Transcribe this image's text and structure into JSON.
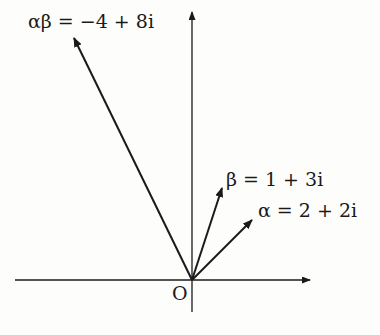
{
  "diagram": {
    "type": "argand-diagram",
    "origin_label": "O",
    "vectors": [
      {
        "name": "alpha",
        "label": "α = 2 + 2i",
        "re": 2,
        "im": 2
      },
      {
        "name": "beta",
        "label": "β = 1 + 3i",
        "re": 1,
        "im": 3
      },
      {
        "name": "alpha-beta",
        "label": "αβ = −4 + 8i",
        "re": -4,
        "im": 8
      }
    ],
    "axes": {
      "horizontal": "real",
      "vertical": "imaginary"
    },
    "caption": ""
  }
}
